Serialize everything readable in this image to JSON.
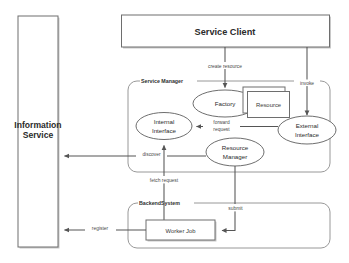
{
  "diagram": {
    "colors": {
      "background": "#ffffff",
      "line": "#555555",
      "box_border": "#6e6e6e",
      "group_border": "#8d8d8d",
      "text": "#2b2b2b",
      "shadow": "#c8c8c8"
    },
    "nodes": {
      "information_service": {
        "label_line1": "Information",
        "label_line2": "Service"
      },
      "service_client": {
        "label": "Service Client"
      },
      "service_manager_group": {
        "label": "Service Manager"
      },
      "backend_system_group": {
        "label": "BackendSystem"
      },
      "factory": {
        "label": "Factory"
      },
      "resource": {
        "label": "Resource"
      },
      "internal_interface": {
        "label_line1": "Internal",
        "label_line2": "Interface"
      },
      "external_interface": {
        "label_line1": "External",
        "label_line2": "Interface"
      },
      "resource_manager": {
        "label_line1": "Resource",
        "label_line2": "Manager"
      },
      "worker_job": {
        "label": "Worker Job"
      }
    },
    "edges": [
      {
        "id": "create-resource",
        "label": "create resource",
        "from": "service_client",
        "to": "factory"
      },
      {
        "id": "invoke",
        "label": "invoke",
        "from": "service_client",
        "to": "external_interface"
      },
      {
        "id": "forward-request",
        "label_line1": "forward",
        "label_line2": "request",
        "from": "external_interface",
        "to": "internal_interface"
      },
      {
        "id": "discover",
        "label": "discover",
        "from": "internal_interface",
        "to": "information_service"
      },
      {
        "id": "fetch-request",
        "label": "fetch request",
        "from": "worker_job",
        "to": "internal_interface"
      },
      {
        "id": "submit",
        "label": "submit",
        "from": "resource_manager",
        "to": "worker_job"
      },
      {
        "id": "register",
        "label": "register",
        "from": "worker_job",
        "to": "information_service"
      }
    ]
  }
}
